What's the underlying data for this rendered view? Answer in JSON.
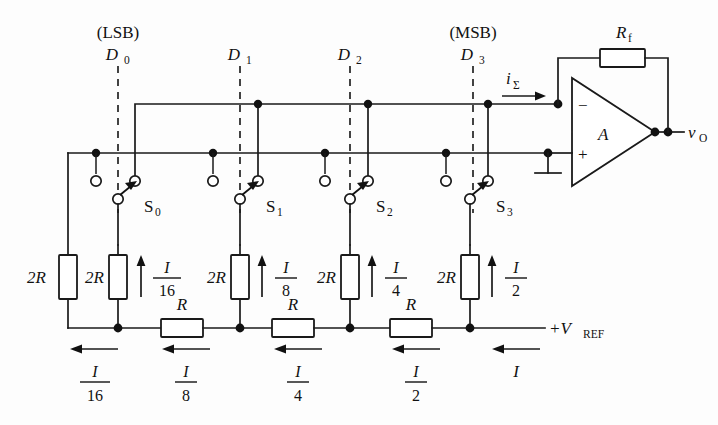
{
  "diagram": {
    "type": "schematic"
  },
  "bits": [
    {
      "name": "D_0",
      "letter": "D",
      "index": "0",
      "significance": "(LSB)",
      "switch": "S",
      "switch_index": "0",
      "shunt_resistor": "2R",
      "branch_current_num": "I",
      "branch_current_den": "16",
      "rail_current_num": "I",
      "rail_current_den": "16"
    },
    {
      "name": "D_1",
      "letter": "D",
      "index": "1",
      "significance": "",
      "switch": "S",
      "switch_index": "1",
      "shunt_resistor": "2R",
      "branch_current_num": "I",
      "branch_current_den": "8",
      "rail_current_num": "I",
      "rail_current_den": "8"
    },
    {
      "name": "D_2",
      "letter": "D",
      "index": "2",
      "significance": "",
      "switch": "S",
      "switch_index": "2",
      "shunt_resistor": "2R",
      "branch_current_num": "I",
      "branch_current_den": "4",
      "rail_current_num": "I",
      "rail_current_den": "4"
    },
    {
      "name": "D_3",
      "letter": "D",
      "index": "3",
      "significance": "(MSB)",
      "switch": "S",
      "switch_index": "3",
      "shunt_resistor": "2R",
      "branch_current_num": "I",
      "branch_current_den": "2",
      "rail_current_num": "I",
      "rail_current_den": "2"
    }
  ],
  "labels": {
    "terminating_resistor": "2R",
    "series_resistor": "R",
    "feedback_resistor": "R",
    "feedback_resistor_sub": "f",
    "amplifier": "A",
    "summing_current": "i",
    "summing_current_sub": "Σ",
    "output": "v",
    "output_sub": "O",
    "reference": "+V",
    "reference_sub": "REF",
    "source_current": "I",
    "inverting_input": "−",
    "noninverting_input": "+"
  },
  "series_resistors": [
    "R",
    "R",
    "R"
  ],
  "colors": {
    "background": "#fdfdfd",
    "ink": "#1a1a1a",
    "dashed": "#3a3a3a",
    "resistor_fill": "#ffffff"
  }
}
